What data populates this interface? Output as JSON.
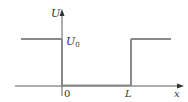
{
  "diagram": {
    "type": "finite-potential-well",
    "y_axis_label": "U",
    "x_axis_label": "x",
    "level_label_main": "U",
    "level_label_sub": "0",
    "origin_label": "0",
    "well_width_label": "L",
    "colors": {
      "axis": "#333333",
      "potential": "#8a8a8a"
    }
  }
}
